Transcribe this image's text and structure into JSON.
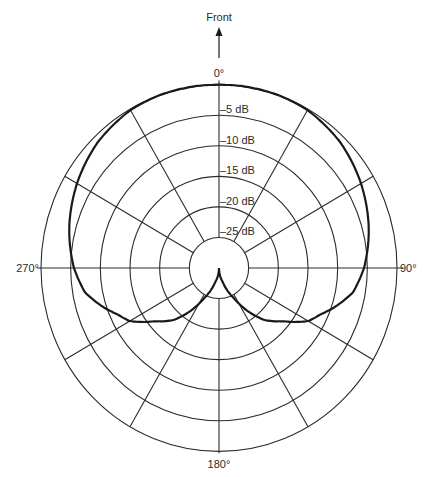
{
  "title": "Front",
  "center": {
    "x": 219,
    "y": 268
  },
  "y_scale": 1.03,
  "outer_radius": 178,
  "colors": {
    "grid": "#2b2b2b",
    "curve": "#1a1a1a",
    "text": "#2a2a2a",
    "background": "#ffffff"
  },
  "angle_labels": [
    {
      "angle": 0,
      "text": "0°"
    },
    {
      "angle": 90,
      "text": "90°"
    },
    {
      "angle": 180,
      "text": "180°"
    },
    {
      "angle": 270,
      "text": "270°"
    }
  ],
  "rings": [
    {
      "level_db": 0,
      "label": ""
    },
    {
      "level_db": -5,
      "label": "–5 dB"
    },
    {
      "level_db": -10,
      "label": "–10 dB"
    },
    {
      "level_db": -15,
      "label": "–15 dB"
    },
    {
      "level_db": -20,
      "label": "–20 dB"
    },
    {
      "level_db": -25,
      "label": "–25 dB"
    }
  ],
  "spoke_step_deg": 30,
  "chart_data": {
    "type": "polar",
    "title": "Front",
    "r_axis": {
      "unit": "dB",
      "range": [
        -30,
        0
      ],
      "ticks": [
        0,
        -5,
        -10,
        -15,
        -20,
        -25
      ]
    },
    "theta_ticks": [
      0,
      90,
      180,
      270
    ],
    "series": [
      {
        "name": "cardioid pickup pattern",
        "theta": [
          0,
          20,
          30,
          45,
          60,
          75,
          90,
          100,
          114,
          120,
          129,
          140,
          153,
          165,
          180,
          195,
          207,
          220,
          231,
          240,
          246,
          260,
          270,
          285,
          300,
          315,
          330,
          340,
          360
        ],
        "db": [
          0,
          0,
          -0.1,
          -0.3,
          -0.8,
          -1.3,
          -1.9,
          -2.4,
          -3.8,
          -4.2,
          -5.4,
          -6.7,
          -8.5,
          -10.5,
          -30,
          -10.5,
          -8.5,
          -6.7,
          -5.4,
          -4.2,
          -3.8,
          -2.4,
          -1.9,
          -1.3,
          -0.8,
          -0.3,
          -0.1,
          0,
          0
        ]
      }
    ]
  },
  "curve_px": {
    "theta": [
      0,
      20,
      30,
      45,
      60,
      75,
      90,
      100,
      108,
      114,
      120,
      129,
      138,
      145,
      153,
      165,
      180
    ],
    "r": [
      178,
      178,
      177,
      172,
      164,
      155,
      145,
      136,
      122,
      111,
      103,
      82,
      68,
      52,
      33,
      14,
      0
    ]
  }
}
